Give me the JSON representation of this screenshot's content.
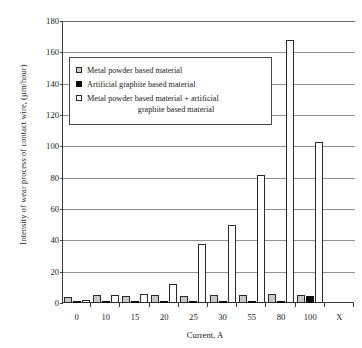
{
  "chart_data": {
    "type": "bar",
    "title": "",
    "xlabel": "Current, A",
    "ylabel": "Intensity of wear process of contact wire, (µm/hour)",
    "categories": [
      "0",
      "10",
      "15",
      "20",
      "25",
      "30",
      "55",
      "80",
      "100",
      "X"
    ],
    "ylim": [
      0,
      180
    ],
    "yticks": [
      0,
      20,
      40,
      60,
      80,
      100,
      120,
      140,
      160,
      180
    ],
    "grid": true,
    "legend_position": "upper-left-inside",
    "series": [
      {
        "name": "Metal powder based material",
        "color": "#c9c9c9",
        "values": [
          4.0,
          4.8,
          4.2,
          5.2,
          4.6,
          5.0,
          5.4,
          6.0,
          5.0,
          0
        ]
      },
      {
        "name": "Artificial graphite based material",
        "color": "#0d0d0d",
        "values": [
          1.2,
          0.4,
          0.4,
          0.8,
          0.8,
          0.8,
          1.2,
          1.6,
          4.4,
          0
        ]
      },
      {
        "name": "Metal powder based material + artificial graphite based material",
        "color": "#ffffff",
        "values": [
          2.0,
          5.0,
          6.0,
          12.0,
          37.5,
          49.5,
          82.0,
          168.0,
          103.0,
          0
        ]
      }
    ]
  },
  "legend": {
    "items": [
      {
        "swatch": "s0",
        "label": "Metal powder based material",
        "line2": ""
      },
      {
        "swatch": "s1",
        "label": "Artificial graphite based material",
        "line2": ""
      },
      {
        "swatch": "s2",
        "label": "Metal powder based material + artificial",
        "line2": "graphite based material"
      }
    ]
  }
}
